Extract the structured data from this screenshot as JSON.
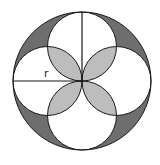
{
  "diagram": {
    "title": "",
    "label_radius": "r",
    "colors": {
      "background": "#ffffff",
      "outline": "#1a1a1a",
      "dark_region": "#6e6e6e",
      "light_region": "#bdbdbd"
    },
    "outer_circle": {
      "cx": 82,
      "cy": 81,
      "r": 69
    },
    "inner_circles": [
      {
        "position": "top",
        "cx": 82,
        "cy": 46.5,
        "r": 34.5
      },
      {
        "position": "bottom",
        "cx": 82,
        "cy": 115.5,
        "r": 34.5
      },
      {
        "position": "left",
        "cx": 47.5,
        "cy": 81,
        "r": 34.5
      },
      {
        "position": "right",
        "cx": 116.5,
        "cy": 81,
        "r": 34.5
      }
    ]
  }
}
